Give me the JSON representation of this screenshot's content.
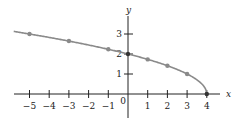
{
  "chart_data": {
    "type": "line",
    "title": "",
    "xlabel": "x",
    "ylabel": "y",
    "xlim": [
      -5.5,
      4.6
    ],
    "ylim": [
      0,
      3.6
    ],
    "grid": false,
    "x_ticks": [
      -5,
      -4,
      -3,
      -2,
      -1,
      0,
      1,
      2,
      3,
      4
    ],
    "x_tick_labels": [
      "−5",
      "−4",
      "−3",
      "−2",
      "−1",
      "0",
      "1",
      "2",
      "3",
      "4"
    ],
    "y_ticks": [
      1,
      2,
      3
    ],
    "y_tick_labels": [
      "1",
      "2",
      "3"
    ],
    "series": [
      {
        "name": "y = √(4 − x)",
        "x": [
          -5,
          -3,
          -1,
          0,
          1,
          2,
          3,
          4
        ],
        "y": [
          3,
          2.65,
          2.24,
          2,
          1.73,
          1.41,
          1,
          0
        ],
        "marked_points": true
      }
    ],
    "colors": {
      "curve": "#8a8a8a",
      "points": "#8a8a8a",
      "axes": "#222222"
    }
  }
}
